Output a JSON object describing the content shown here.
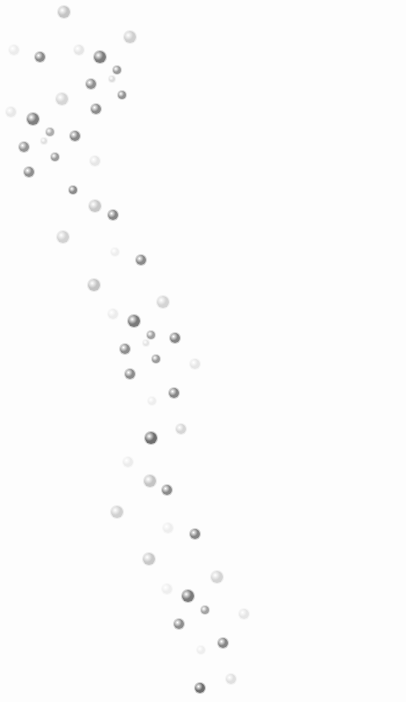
{
  "image": {
    "description": "Scattered gray droplets on a white background forming a diagonal band from top-left to bottom-center",
    "background": "#fdfdfd",
    "dots": [
      {
        "x": 64,
        "y": 12,
        "r": 6,
        "c": "#c4c4c4"
      },
      {
        "x": 130,
        "y": 37,
        "r": 6,
        "c": "#cfcfcf"
      },
      {
        "x": 14,
        "y": 50,
        "r": 5,
        "c": "#ececec"
      },
      {
        "x": 40,
        "y": 57,
        "r": 5,
        "c": "#8a8a8a"
      },
      {
        "x": 79,
        "y": 50,
        "r": 5,
        "c": "#e6e6e6"
      },
      {
        "x": 100,
        "y": 57,
        "r": 6,
        "c": "#7d7d7d"
      },
      {
        "x": 117,
        "y": 70,
        "r": 4,
        "c": "#9a9a9a"
      },
      {
        "x": 112,
        "y": 79,
        "r": 3,
        "c": "#dcdcdc"
      },
      {
        "x": 91,
        "y": 84,
        "r": 5,
        "c": "#909090"
      },
      {
        "x": 122,
        "y": 95,
        "r": 4,
        "c": "#929292"
      },
      {
        "x": 62,
        "y": 99,
        "r": 6,
        "c": "#d6d6d6"
      },
      {
        "x": 96,
        "y": 109,
        "r": 5,
        "c": "#8c8c8c"
      },
      {
        "x": 11,
        "y": 112,
        "r": 5,
        "c": "#e8e8e8"
      },
      {
        "x": 33,
        "y": 119,
        "r": 6,
        "c": "#7f7f7f"
      },
      {
        "x": 50,
        "y": 132,
        "r": 4,
        "c": "#acacac"
      },
      {
        "x": 75,
        "y": 136,
        "r": 5,
        "c": "#888888"
      },
      {
        "x": 44,
        "y": 141,
        "r": 3,
        "c": "#e0e0e0"
      },
      {
        "x": 24,
        "y": 147,
        "r": 5,
        "c": "#959595"
      },
      {
        "x": 55,
        "y": 157,
        "r": 4,
        "c": "#9a9a9a"
      },
      {
        "x": 95,
        "y": 161,
        "r": 5,
        "c": "#e6e6e6"
      },
      {
        "x": 29,
        "y": 172,
        "r": 5,
        "c": "#8e8e8e"
      },
      {
        "x": 73,
        "y": 190,
        "r": 4,
        "c": "#8a8a8a"
      },
      {
        "x": 95,
        "y": 206,
        "r": 6,
        "c": "#c8c8c8"
      },
      {
        "x": 113,
        "y": 215,
        "r": 5,
        "c": "#868686"
      },
      {
        "x": 63,
        "y": 237,
        "r": 6,
        "c": "#d2d2d2"
      },
      {
        "x": 115,
        "y": 252,
        "r": 4,
        "c": "#eeeeee"
      },
      {
        "x": 141,
        "y": 260,
        "r": 5,
        "c": "#8a8a8a"
      },
      {
        "x": 94,
        "y": 285,
        "r": 6,
        "c": "#c2c2c2"
      },
      {
        "x": 163,
        "y": 302,
        "r": 6,
        "c": "#d4d4d4"
      },
      {
        "x": 113,
        "y": 314,
        "r": 5,
        "c": "#ececec"
      },
      {
        "x": 134,
        "y": 321,
        "r": 6,
        "c": "#7a7a7a"
      },
      {
        "x": 151,
        "y": 335,
        "r": 4,
        "c": "#a0a0a0"
      },
      {
        "x": 175,
        "y": 338,
        "r": 5,
        "c": "#858585"
      },
      {
        "x": 146,
        "y": 343,
        "r": 3,
        "c": "#e4e4e4"
      },
      {
        "x": 125,
        "y": 349,
        "r": 5,
        "c": "#8e8e8e"
      },
      {
        "x": 156,
        "y": 359,
        "r": 4,
        "c": "#9a9a9a"
      },
      {
        "x": 195,
        "y": 364,
        "r": 5,
        "c": "#e6e6e6"
      },
      {
        "x": 130,
        "y": 374,
        "r": 5,
        "c": "#8c8c8c"
      },
      {
        "x": 174,
        "y": 393,
        "r": 5,
        "c": "#868686"
      },
      {
        "x": 152,
        "y": 401,
        "r": 4,
        "c": "#eeeeee"
      },
      {
        "x": 151,
        "y": 438,
        "r": 6,
        "c": "#6e6e6e"
      },
      {
        "x": 181,
        "y": 429,
        "r": 5,
        "c": "#d6d6d6"
      },
      {
        "x": 128,
        "y": 462,
        "r": 5,
        "c": "#ececec"
      },
      {
        "x": 150,
        "y": 481,
        "r": 6,
        "c": "#c4c4c4"
      },
      {
        "x": 167,
        "y": 490,
        "r": 5,
        "c": "#8a8a8a"
      },
      {
        "x": 117,
        "y": 512,
        "r": 6,
        "c": "#d0d0d0"
      },
      {
        "x": 168,
        "y": 528,
        "r": 5,
        "c": "#eeeeee"
      },
      {
        "x": 195,
        "y": 534,
        "r": 5,
        "c": "#858585"
      },
      {
        "x": 149,
        "y": 559,
        "r": 6,
        "c": "#c8c8c8"
      },
      {
        "x": 217,
        "y": 577,
        "r": 6,
        "c": "#d4d4d4"
      },
      {
        "x": 167,
        "y": 589,
        "r": 5,
        "c": "#eeeeee"
      },
      {
        "x": 188,
        "y": 596,
        "r": 6,
        "c": "#7a7a7a"
      },
      {
        "x": 205,
        "y": 610,
        "r": 4,
        "c": "#a2a2a2"
      },
      {
        "x": 244,
        "y": 614,
        "r": 5,
        "c": "#e6e6e6"
      },
      {
        "x": 179,
        "y": 624,
        "r": 5,
        "c": "#8e8e8e"
      },
      {
        "x": 223,
        "y": 643,
        "r": 5,
        "c": "#868686"
      },
      {
        "x": 201,
        "y": 650,
        "r": 4,
        "c": "#eeeeee"
      },
      {
        "x": 231,
        "y": 679,
        "r": 5,
        "c": "#e0e0e0"
      },
      {
        "x": 200,
        "y": 688,
        "r": 5,
        "c": "#6e6e6e"
      }
    ]
  }
}
